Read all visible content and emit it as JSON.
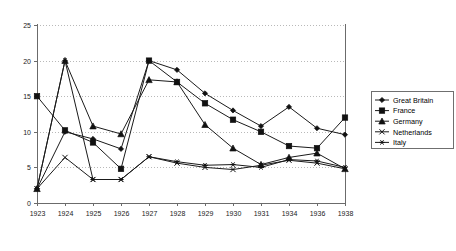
{
  "chart_data": {
    "type": "line",
    "title": "",
    "subtitle": "",
    "xlabel": "",
    "ylabel": "",
    "grid": true,
    "legend_position": "right",
    "categories": [
      "1923",
      "1924",
      "1925",
      "1926",
      "1927",
      "1928",
      "1929",
      "1930",
      "1931",
      "1934",
      "1936",
      "1938"
    ],
    "x": [
      "1923",
      "1924",
      "1925",
      "1926",
      "1927",
      "1928",
      "1929",
      "1930",
      "1931",
      "1934",
      "1936",
      "1938"
    ],
    "ylim": [
      0,
      25
    ],
    "yticks": [
      0,
      5,
      10,
      15,
      20,
      25
    ],
    "ytick_labels": [
      "0",
      "5",
      "10",
      "15",
      "20",
      "25"
    ],
    "xtick_labels": [
      "1923",
      "1924",
      "1925",
      "1926",
      "1927",
      "1928",
      "1929",
      "1930",
      "1931",
      "1934",
      "1936",
      "1938"
    ],
    "series": [
      {
        "name": "Great Britain",
        "marker": "diamond",
        "values": [
          2.0,
          10.0,
          9.0,
          7.6,
          20.0,
          18.7,
          15.4,
          13.0,
          10.8,
          13.5,
          10.5,
          9.6
        ]
      },
      {
        "name": "France",
        "marker": "square",
        "values": [
          15.0,
          10.2,
          8.5,
          4.8,
          20.0,
          17.0,
          14.0,
          11.7,
          10.0,
          8.0,
          7.7,
          12.0
        ]
      },
      {
        "name": "Germany",
        "marker": "triangle",
        "values": [
          2.0,
          20.0,
          10.8,
          9.7,
          17.3,
          17.0,
          11.0,
          7.7,
          5.4,
          6.4,
          7.0,
          4.8
        ]
      },
      {
        "name": "Netherlands",
        "marker": "cross",
        "values": [
          2.0,
          6.4,
          3.3,
          3.3,
          6.5,
          5.6,
          5.0,
          4.7,
          5.3,
          6.0,
          5.6,
          4.8
        ]
      },
      {
        "name": "Italy",
        "marker": "asterisk",
        "values": [
          2.0,
          20.0,
          3.3,
          3.3,
          6.5,
          5.8,
          5.3,
          5.4,
          5.0,
          6.1,
          5.9,
          5.0
        ]
      }
    ],
    "legend_entries": [
      "Great Britain",
      "France",
      "Germany",
      "Netherlands",
      "Italy"
    ],
    "colors": {
      "series": "#111111",
      "grid": "#b9b9b9",
      "axis": "#6b6b6b",
      "background": "#ffffff"
    }
  }
}
